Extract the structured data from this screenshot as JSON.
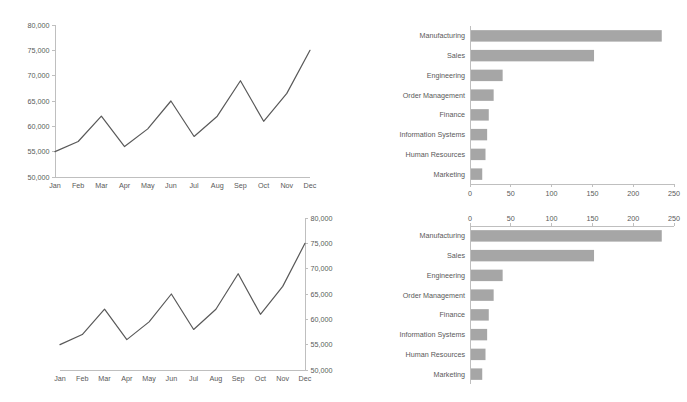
{
  "chart_data": [
    {
      "id": "line-chart-top-left",
      "type": "line",
      "title": "",
      "xlabel": "",
      "ylabel": "",
      "categories": [
        "Jan",
        "Feb",
        "Mar",
        "Apr",
        "May",
        "Jun",
        "Jul",
        "Aug",
        "Sep",
        "Oct",
        "Nov",
        "Dec"
      ],
      "values": [
        55000,
        57000,
        62000,
        56000,
        59500,
        65000,
        58000,
        62000,
        69000,
        61000,
        66500,
        75000
      ],
      "ylim": [
        50000,
        80000
      ],
      "ytick_step": 5000,
      "ytick_labels": [
        "50,000",
        "55,000",
        "60,000",
        "65,000",
        "70,000",
        "75,000",
        "80,000"
      ],
      "y_axis_position": "left",
      "x_axis_position": "bottom",
      "grid": false,
      "legend": "none",
      "line_color": "#595959"
    },
    {
      "id": "bar-chart-top-right",
      "type": "bar",
      "orientation": "horizontal",
      "title": "",
      "xlabel": "",
      "ylabel": "",
      "categories": [
        "Manufacturing",
        "Sales",
        "Engineering",
        "Order Management",
        "Finance",
        "Information Systems",
        "Human Resources",
        "Marketing"
      ],
      "values": [
        235,
        152,
        40,
        29,
        23,
        21,
        19,
        15
      ],
      "xlim": [
        0,
        250
      ],
      "xtick_step": 50,
      "xtick_labels": [
        "0",
        "50",
        "100",
        "150",
        "200",
        "250"
      ],
      "x_axis_position": "bottom",
      "y_axis_position": "left",
      "grid": false,
      "legend": "none",
      "bar_color": "#a6a6a6"
    },
    {
      "id": "line-chart-bottom-left",
      "type": "line",
      "title": "",
      "xlabel": "",
      "ylabel": "",
      "categories": [
        "Jan",
        "Feb",
        "Mar",
        "Apr",
        "May",
        "Jun",
        "Jul",
        "Aug",
        "Sep",
        "Oct",
        "Nov",
        "Dec"
      ],
      "values": [
        55000,
        57000,
        62000,
        56000,
        59500,
        65000,
        58000,
        62000,
        69000,
        61000,
        66500,
        75000
      ],
      "ylim": [
        50000,
        80000
      ],
      "ytick_step": 5000,
      "ytick_labels": [
        "50,000",
        "55,000",
        "60,000",
        "65,000",
        "70,000",
        "75,000",
        "80,000"
      ],
      "y_axis_position": "right",
      "x_axis_position": "bottom",
      "grid": false,
      "legend": "none",
      "line_color": "#595959"
    },
    {
      "id": "bar-chart-bottom-right",
      "type": "bar",
      "orientation": "horizontal",
      "title": "",
      "xlabel": "",
      "ylabel": "",
      "categories": [
        "Manufacturing",
        "Sales",
        "Engineering",
        "Order Management",
        "Finance",
        "Information Systems",
        "Human Resources",
        "Marketing"
      ],
      "values": [
        235,
        152,
        40,
        29,
        23,
        21,
        19,
        15
      ],
      "xlim": [
        0,
        250
      ],
      "xtick_step": 50,
      "xtick_labels": [
        "0",
        "50",
        "100",
        "150",
        "200",
        "250"
      ],
      "x_axis_position": "top",
      "y_axis_position": "left",
      "grid": false,
      "legend": "none",
      "bar_color": "#a6a6a6"
    }
  ],
  "colors": {
    "line": "#595959",
    "bar": "#a6a6a6",
    "axis": "#bfbfbf",
    "text": "#595959",
    "background": "#ffffff"
  }
}
